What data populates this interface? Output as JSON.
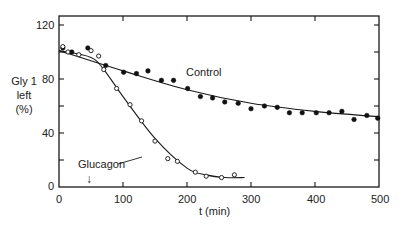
{
  "chart_data": {
    "type": "scatter",
    "title": "",
    "xlabel": "t (min)",
    "ylabel": [
      "Gly 1",
      "left",
      "(%)"
    ],
    "xlim": [
      0,
      500
    ],
    "ylim": [
      0,
      130
    ],
    "xticks": [
      0,
      100,
      200,
      300,
      400,
      500
    ],
    "yticks": [
      0,
      40,
      80,
      120
    ],
    "grid": false,
    "legend": "inline labels",
    "annotations": [
      {
        "text": "Control",
        "near": [
          190,
          82
        ]
      },
      {
        "text": "Glucagon",
        "near": [
          100,
          12
        ]
      },
      {
        "text": "↓",
        "meaning": "glucagon addition",
        "at": [
          45,
          5
        ]
      }
    ],
    "series": [
      {
        "name": "Control",
        "marker": "filled-circle",
        "x": [
          6,
          20,
          45,
          73,
          101,
          121,
          139,
          160,
          179,
          201,
          221,
          240,
          259,
          280,
          300,
          321,
          341,
          360,
          380,
          402,
          422,
          442,
          461,
          481,
          498
        ],
        "y": [
          103,
          100,
          103,
          90,
          85,
          84,
          86,
          79,
          79,
          73,
          67,
          66,
          63,
          62,
          58,
          60,
          59,
          55,
          55,
          55,
          55,
          56,
          50,
          53,
          51
        ]
      },
      {
        "name": "Glucagon",
        "marker": "open-circle",
        "x": [
          6,
          14,
          31,
          50,
          62,
          70,
          90,
          111,
          129,
          150,
          170,
          185,
          213,
          230,
          254,
          274
        ],
        "y": [
          104,
          100,
          98,
          101,
          97,
          87,
          73,
          61,
          49,
          34,
          21,
          19,
          11,
          8,
          7,
          9
        ]
      }
    ],
    "fit_curves": [
      {
        "name": "Control fit",
        "x": [
          0,
          100,
          200,
          300,
          400,
          500
        ],
        "y": [
          101,
          86,
          72,
          62,
          56,
          52
        ]
      },
      {
        "name": "Glucagon fit",
        "x": [
          0,
          50,
          70,
          100,
          150,
          200,
          230,
          260,
          290
        ],
        "y": [
          101,
          96,
          87,
          67,
          36,
          14,
          9,
          7,
          7
        ]
      }
    ]
  },
  "labels": {
    "ytitle_1": "Gly 1",
    "ytitle_2": "left",
    "ytitle_3": "(%)",
    "xtitle": "t (min)",
    "control": "Control",
    "glucagon": "Glucagon",
    "arrow": "↓",
    "yt0": "0",
    "yt40": "40",
    "yt80": "80",
    "yt120": "120",
    "xt0": "0",
    "xt100": "100",
    "xt200": "200",
    "xt300": "300",
    "xt400": "400",
    "xt500": "500"
  }
}
